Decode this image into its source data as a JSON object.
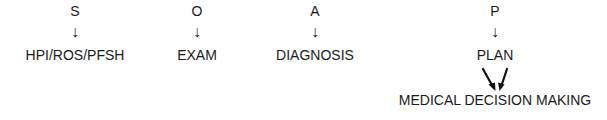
{
  "diagram": {
    "type": "flow",
    "columns": [
      {
        "letter": "S",
        "arrow": "↓",
        "label": "HPI/ROS/PFSH"
      },
      {
        "letter": "O",
        "arrow": "↓",
        "label": "EXAM"
      },
      {
        "letter": "A",
        "arrow": "↓",
        "label": "DIAGNOSIS"
      },
      {
        "letter": "P",
        "arrow": "↓",
        "label": "PLAN"
      }
    ],
    "converging_arrows": "two diagonal arrows pointing down toward center",
    "bottom_label": "MEDICAL DECISION MAKING"
  }
}
